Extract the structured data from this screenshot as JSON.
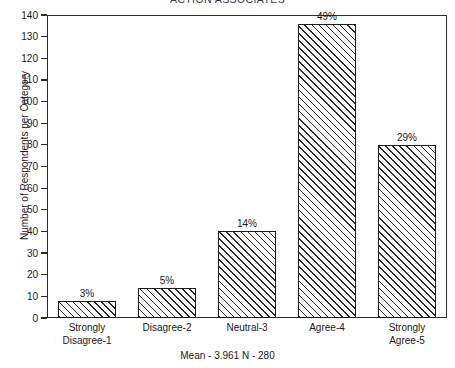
{
  "chart_data": {
    "type": "bar",
    "title": "ACTION ASSOCIATES",
    "xlabel": "",
    "ylabel": "Number of Respondents per Category",
    "categories": [
      "Strongly Disagree-1",
      "Disagree-2",
      "Neutral-3",
      "Agree-4",
      "Strongly Agree-5"
    ],
    "category_lines": [
      [
        "Strongly",
        "Disagree-1"
      ],
      [
        "Disagree-2",
        ""
      ],
      [
        "Neutral-3",
        ""
      ],
      [
        "Agree-4",
        ""
      ],
      [
        "Strongly",
        "Agree-5"
      ]
    ],
    "values": [
      8,
      14,
      40,
      136,
      80
    ],
    "data_labels": [
      "3%",
      "5%",
      "14%",
      "49%",
      "29%"
    ],
    "percentages": [
      3,
      5,
      14,
      49,
      29
    ],
    "ylim": [
      0,
      140
    ],
    "ytick_step": 10,
    "yticks": [
      0,
      10,
      20,
      30,
      40,
      50,
      60,
      70,
      80,
      90,
      100,
      110,
      120,
      130,
      140
    ],
    "grid": false,
    "legend": false,
    "bar_fill": "diagonal-hatch",
    "bar_edge_color": "#1b1b1b",
    "frame_color": "#2b2b2b",
    "footnote": "Mean - 3.961  N - 280",
    "statistics": {
      "mean_label": "Mean - 3.961",
      "n_label": "N - 280",
      "mean": 3.961,
      "n": 280
    }
  }
}
